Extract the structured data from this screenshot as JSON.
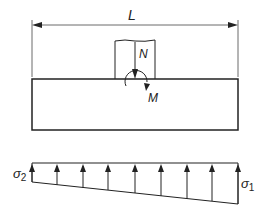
{
  "diagram": {
    "dimension_label": "L",
    "axial_force_label": "N",
    "moment_label": "M",
    "stress_left": {
      "symbol": "σ",
      "subscript": "2"
    },
    "stress_right": {
      "symbol": "σ",
      "subscript": "1"
    },
    "stress_arrow_count": 9,
    "colors": {
      "line": "#222222",
      "background": "#ffffff"
    }
  }
}
